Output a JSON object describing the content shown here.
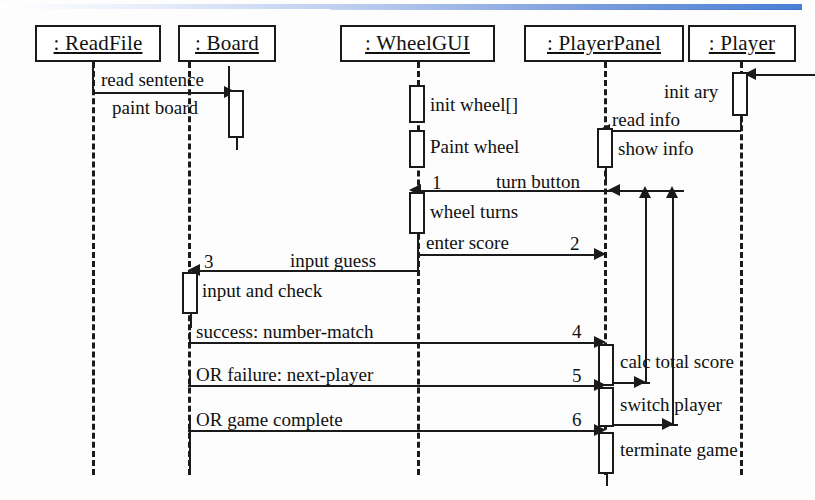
{
  "diagram": {
    "kind": "uml-sequence-diagram",
    "title_bar": {
      "accent_color": "#4a7fd4"
    },
    "objects": [
      {
        "id": "readfile",
        "label": ": ReadFile",
        "x": 35,
        "y": 25,
        "w": 126,
        "h": 37,
        "lifeline_x": 92
      },
      {
        "id": "board",
        "label": ": Board",
        "x": 178,
        "y": 25,
        "w": 98,
        "h": 37,
        "lifeline_x": 188
      },
      {
        "id": "wheelgui",
        "label": ": WheelGUI",
        "x": 340,
        "y": 25,
        "w": 155,
        "h": 37,
        "lifeline_x": 417
      },
      {
        "id": "playerpanel",
        "label": ": PlayerPanel",
        "x": 524,
        "y": 25,
        "w": 160,
        "h": 37,
        "lifeline_x": 604
      },
      {
        "id": "player",
        "label": ": Player",
        "x": 688,
        "y": 25,
        "w": 108,
        "h": 37,
        "lifeline_x": 740
      }
    ],
    "messages": [
      {
        "seq": "",
        "label": "read sentence",
        "from": "readfile",
        "to": "readfile",
        "y": 78
      },
      {
        "seq": "",
        "label": "paint board",
        "from": "readfile",
        "to": "board",
        "y": 101
      },
      {
        "seq": "",
        "label": "init wheel[]",
        "from": "wheelgui",
        "to": "wheelgui",
        "y": 104
      },
      {
        "seq": "",
        "label": "init ary",
        "from": "external",
        "to": "player",
        "y": 78
      },
      {
        "seq": "",
        "label": "Paint wheel",
        "from": "wheelgui",
        "to": "wheelgui",
        "y": 145
      },
      {
        "seq": "",
        "label": "read info",
        "from": "player",
        "to": "playerpanel",
        "y": 120
      },
      {
        "seq": "",
        "label": "show info",
        "from": "playerpanel",
        "to": "playerpanel",
        "y": 148
      },
      {
        "seq": "1",
        "label": "turn button",
        "from": "playerpanel",
        "to": "wheelgui",
        "y": 190
      },
      {
        "seq": "",
        "label": "wheel turns",
        "from": "wheelgui",
        "to": "wheelgui",
        "y": 210
      },
      {
        "seq": "2",
        "label": "enter score",
        "from": "wheelgui",
        "to": "playerpanel",
        "y": 254
      },
      {
        "seq": "3",
        "label": "input guess",
        "from": "wheelgui",
        "to": "board",
        "y": 270
      },
      {
        "seq": "",
        "label": "input and check",
        "from": "board",
        "to": "board",
        "y": 290
      },
      {
        "seq": "4",
        "label": "success: number-match",
        "from": "board",
        "to": "playerpanel",
        "y": 342
      },
      {
        "seq": "",
        "label": "calc total score",
        "from": "playerpanel",
        "to": "playerpanel",
        "y": 360
      },
      {
        "seq": "5",
        "label": "OR failure: next-player",
        "from": "board",
        "to": "playerpanel",
        "y": 385
      },
      {
        "seq": "",
        "label": "switch player",
        "from": "playerpanel",
        "to": "playerpanel",
        "y": 403
      },
      {
        "seq": "6",
        "label": "OR game complete",
        "from": "board",
        "to": "playerpanel",
        "y": 430
      },
      {
        "seq": "",
        "label": "terminate game",
        "from": "playerpanel",
        "to": "playerpanel",
        "y": 447
      }
    ],
    "sequence_numbers": [
      "1",
      "2",
      "3",
      "4",
      "5",
      "6"
    ],
    "return_arrows": [
      {
        "id": "return-calc-total-score",
        "from_y": 368,
        "to_y": 190,
        "x": 645
      },
      {
        "id": "return-switch-player",
        "from_y": 412,
        "to_y": 190,
        "x": 672
      }
    ]
  },
  "labels": {
    "read_sentence": "read sentence",
    "paint_board": "paint board",
    "init_wheel": "init wheel[]",
    "paint_wheel": "Paint wheel",
    "init_ary": "init ary",
    "read_info": "read info",
    "show_info": "show info",
    "turn_button": "turn button",
    "wheel_turns": "wheel turns",
    "enter_score": "enter score",
    "input_guess": "input guess",
    "input_and_check": "input and check",
    "success_number_match": "success: number-match",
    "or_failure_next_player": "OR failure: next-player",
    "or_game_complete": "OR game complete",
    "calc_total_score": "calc total score",
    "switch_player": "switch player",
    "terminate_game": "terminate game",
    "n1": "1",
    "n2": "2",
    "n3": "3",
    "n4": "4",
    "n5": "5",
    "n6": "6"
  }
}
